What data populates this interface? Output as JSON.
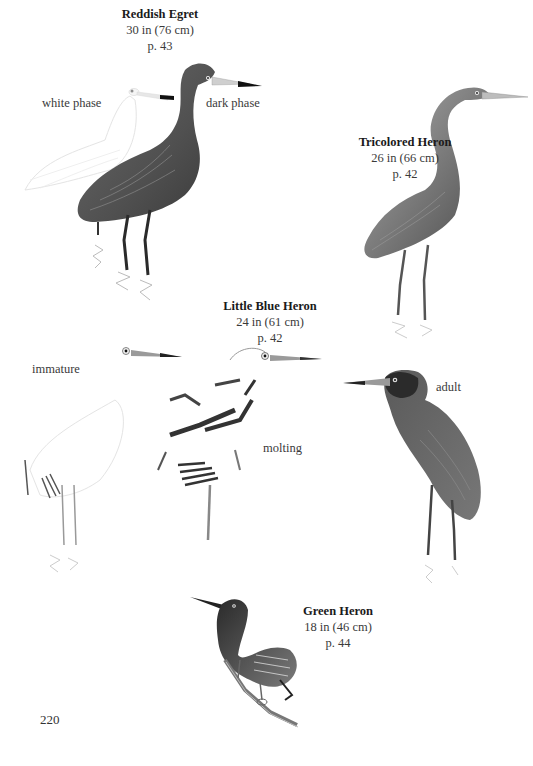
{
  "page": {
    "folio": "220",
    "background": "#ffffff"
  },
  "species": [
    {
      "name": "Reddish Egret",
      "size": "30 in (76 cm)",
      "page_ref": "p. 43",
      "morph_labels": [
        "white phase",
        "dark phase"
      ]
    },
    {
      "name": "Tricolored Heron",
      "size": "26 in (66 cm)",
      "page_ref": "p. 42",
      "morph_labels": []
    },
    {
      "name": "Little Blue Heron",
      "size": "24 in (61 cm)",
      "page_ref": "p. 42",
      "morph_labels": [
        "immature",
        "molting",
        "adult"
      ]
    },
    {
      "name": "Green Heron",
      "size": "18 in (46 cm)",
      "page_ref": "p. 44",
      "morph_labels": []
    }
  ],
  "illustrations": [
    {
      "id": "reddish-egret-white-phase",
      "icon": "heron-illustration-pale"
    },
    {
      "id": "reddish-egret-dark-phase",
      "icon": "heron-illustration-dark"
    },
    {
      "id": "tricolored-heron",
      "icon": "heron-illustration-dark"
    },
    {
      "id": "little-blue-heron-immature",
      "icon": "heron-illustration-pale"
    },
    {
      "id": "little-blue-heron-molting",
      "icon": "heron-illustration-patchy"
    },
    {
      "id": "little-blue-heron-adult",
      "icon": "heron-illustration-dark"
    },
    {
      "id": "green-heron",
      "icon": "heron-illustration-perched"
    }
  ],
  "colors": {
    "text": "#2a2a2a",
    "plumage_dark": "#4a4a4a",
    "plumage_mid": "#7a7a7a",
    "plumage_pale": "#d8d8d8",
    "bill_tip": "#111111"
  }
}
